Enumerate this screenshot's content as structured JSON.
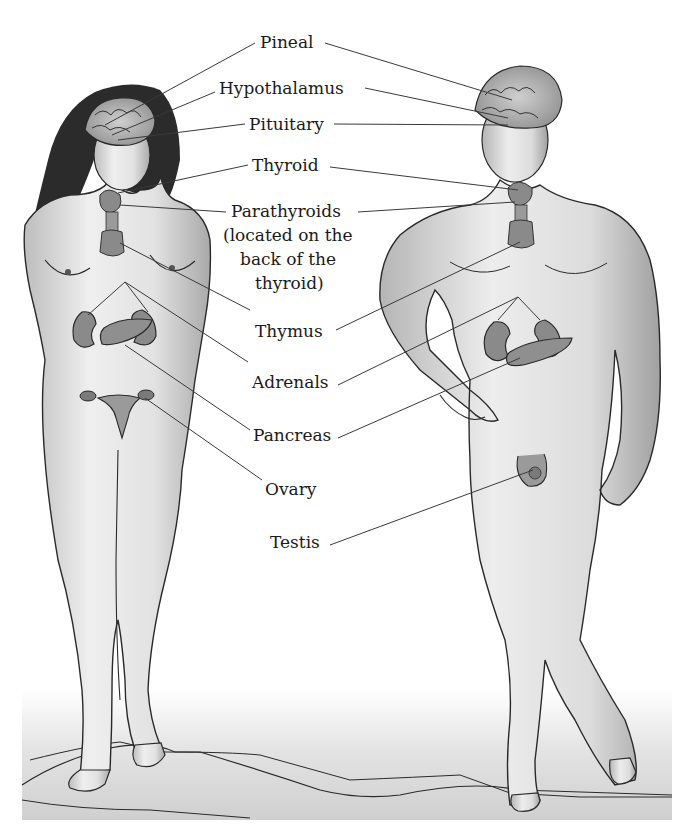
{
  "figure": {
    "type": "anatomical illustration",
    "figures": [
      {
        "name": "female",
        "position": "left"
      },
      {
        "name": "male",
        "position": "right"
      }
    ]
  },
  "labels": [
    {
      "id": "pineal",
      "text": "Pineal",
      "x": 260,
      "y": 2
    },
    {
      "id": "hypothalamus",
      "text": "Hypothalamus",
      "x": 220,
      "y": 78
    },
    {
      "id": "pituitary",
      "text": "Pituitary",
      "x": 250,
      "y": 114
    },
    {
      "id": "thyroid",
      "text": "Thyroid",
      "x": 254,
      "y": 155
    },
    {
      "id": "parathyroids",
      "text": "Parathyroids",
      "x": 232,
      "y": 201
    },
    {
      "id": "parathyroids_note_1",
      "text": "(located on the",
      "x": 222,
      "y": 225
    },
    {
      "id": "parathyroids_note_2",
      "text": "back of the",
      "x": 240,
      "y": 249
    },
    {
      "id": "parathyroids_note_3",
      "text": "thyroid)",
      "x": 255,
      "y": 273
    },
    {
      "id": "thymus",
      "text": "Thymus",
      "x": 255,
      "y": 321
    },
    {
      "id": "adrenals",
      "text": "Adrenals",
      "x": 252,
      "y": 372
    },
    {
      "id": "pancreas",
      "text": "Pancreas",
      "x": 253,
      "y": 425
    },
    {
      "id": "ovary",
      "text": "Ovary",
      "x": 265,
      "y": 479
    },
    {
      "id": "testis",
      "text": "Testis",
      "x": 270,
      "y": 532
    }
  ],
  "colors": {
    "skin_light": "#ececec",
    "skin_mid": "#c8c8c8",
    "outline": "#2a2a2a",
    "gland": "#8a8a8a",
    "hair": "#2b2b2b",
    "ground": "#d6d6d6",
    "leader_line": "#3a3a3a"
  }
}
